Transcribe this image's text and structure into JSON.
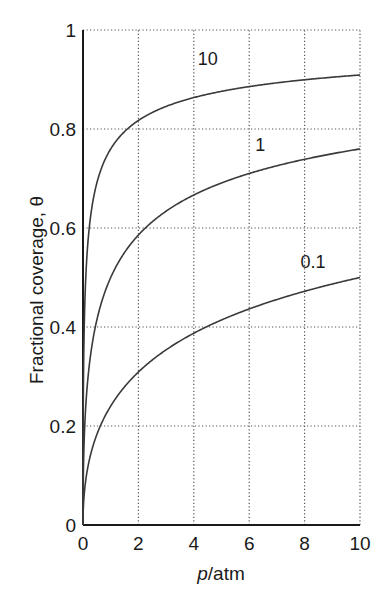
{
  "chart_data": {
    "type": "line",
    "title": "",
    "xlabel_italic": "p",
    "xlabel_rest": "/atm",
    "xlabel": "p/atm",
    "ylabel": "Fractional coverage, θ",
    "xlim": [
      0,
      10
    ],
    "ylim": [
      0,
      1
    ],
    "x_ticks": [
      "0",
      "2",
      "4",
      "6",
      "8",
      "10"
    ],
    "y_ticks": [
      "0",
      "0.2",
      "0.4",
      "0.6",
      "0.8",
      "1"
    ],
    "grid": true,
    "grid_style": "dotted",
    "legend": "inline curve labels",
    "x": [
      0,
      0.25,
      0.5,
      1,
      2,
      4,
      6,
      8,
      10
    ],
    "series": [
      {
        "name": "10",
        "label_x": 4.5,
        "label_y": 0.93,
        "values": [
          0,
          0.613,
          0.691,
          0.76,
          0.817,
          0.864,
          0.886,
          0.899,
          0.909
        ]
      },
      {
        "name": "1",
        "label_x": 6.4,
        "label_y": 0.755,
        "values": [
          0,
          0.333,
          0.414,
          0.5,
          0.586,
          0.667,
          0.71,
          0.739,
          0.76
        ]
      },
      {
        "name": "0.1",
        "label_x": 8.3,
        "label_y": 0.52,
        "values": [
          0,
          0.137,
          0.183,
          0.24,
          0.309,
          0.387,
          0.436,
          0.472,
          0.5
        ]
      }
    ],
    "model": "θ = (Kp)^½ / (1 + (Kp)^½)",
    "K_values": [
      10,
      1,
      0.1
    ]
  },
  "colors": {
    "axis": "#1a1a1a",
    "grid": "#555555",
    "curve": "#3a3a3a"
  }
}
